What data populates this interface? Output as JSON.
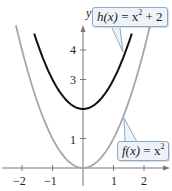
{
  "chart_data": {
    "type": "line",
    "title": "",
    "xlabel": "x",
    "ylabel": "y",
    "xlim": [
      -2.7,
      3
    ],
    "ylim": [
      -0.5,
      5.5
    ],
    "x_ticks": [
      "-2",
      "-1",
      "1",
      "2"
    ],
    "y_ticks": [
      "1",
      "3",
      "4"
    ],
    "grid": false,
    "series": [
      {
        "name": "f(x) = x^2",
        "function": "x^2",
        "color": "#a6a6a6",
        "x_range": [
          -2.2,
          2.2
        ],
        "x": [
          -2,
          -1,
          0,
          1,
          2
        ],
        "values": [
          4,
          1,
          0,
          1,
          4
        ]
      },
      {
        "name": "h(x) = x^2 + 2",
        "function": "x^2 + 2",
        "color": "#111111",
        "x_range": [
          -1.6,
          1.6
        ],
        "x": [
          -1.5,
          -1,
          0,
          1,
          1.5
        ],
        "values": [
          4.25,
          3,
          2,
          3,
          4.25
        ]
      }
    ],
    "annotations": [
      {
        "text": "h(x) = x^2 + 2",
        "points_to": "black curve near (1.3, 3.7)"
      },
      {
        "text": "f(x) = x^2",
        "points_to": "gray curve near (1.35, 1.8)"
      }
    ]
  },
  "labels": {
    "y_axis": "y",
    "x_axis": "x",
    "tick_x": [
      "−2",
      "−1",
      "1",
      "2"
    ],
    "tick_y": [
      "1",
      "3",
      "4"
    ],
    "h_label_fn": "h(x)",
    "h_label_rest": " = x",
    "h_label_exp": "2",
    "h_label_tail": " + 2",
    "f_label_fn": "f(x)",
    "f_label_rest": " = x",
    "f_label_exp": "2"
  }
}
